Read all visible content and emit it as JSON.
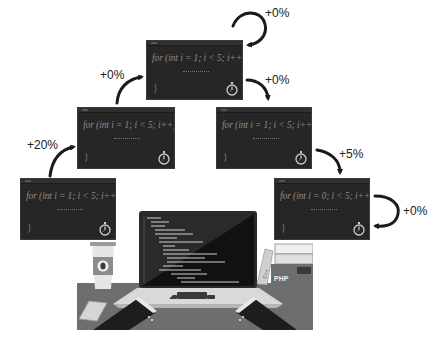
{
  "diagram": {
    "snippets": [
      {
        "id": "snippet-1",
        "code": "for (int i = 1; i < 5; i++) {",
        "body": "..........",
        "close": "}"
      },
      {
        "id": "snippet-2",
        "code": "for (int i = 1; i < 5; i++) {",
        "body": "..........",
        "close": "}"
      },
      {
        "id": "snippet-3",
        "code": "for (int i = 1; i < 5; i++) {",
        "body": "..........",
        "close": "}"
      },
      {
        "id": "snippet-4",
        "code": "for (int i = 1; i < 5; i++) {",
        "body": "..........",
        "close": "}"
      },
      {
        "id": "snippet-5",
        "code": "for (int i = 0; i < 5; i++) {",
        "body": "..........",
        "close": "}"
      }
    ],
    "transitions": [
      {
        "from": "snippet-4",
        "to": "snippet-2",
        "label": "+20%"
      },
      {
        "from": "snippet-2",
        "to": "snippet-1",
        "label": "+0%"
      },
      {
        "from": "snippet-1",
        "to": "snippet-1",
        "label": "+0%"
      },
      {
        "from": "snippet-1",
        "to": "snippet-3",
        "label": "+0%"
      },
      {
        "from": "snippet-3",
        "to": "snippet-5",
        "label": "+5%"
      },
      {
        "from": "snippet-5",
        "to": "snippet-5",
        "label": "+0%"
      }
    ],
    "illustration": {
      "subject": "developer typing on laptop",
      "book_labels": [
        "PHP",
        "C++"
      ],
      "items": [
        "coffee-cup",
        "smartphone",
        "laptop",
        "books"
      ]
    },
    "colors": {
      "editor_bg": "#262626",
      "code_text": "#8a8a8a",
      "arrow": "#1a1a1a",
      "desk": "#6e6e6e",
      "background": "#ffffff"
    }
  }
}
